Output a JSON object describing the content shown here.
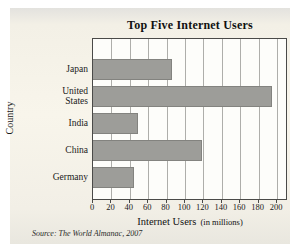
{
  "chart_data": {
    "type": "bar",
    "orientation": "horizontal",
    "title": "Top Five Internet Users",
    "categories": [
      "Japan",
      "United States",
      "India",
      "China",
      "Germany"
    ],
    "values": [
      86,
      195,
      49,
      119,
      45
    ],
    "xlabel": "Internet Users",
    "xlabel_unit": "(in millions)",
    "ylabel": "Country",
    "xticks": [
      0,
      20,
      40,
      60,
      80,
      100,
      120,
      140,
      160,
      180,
      200
    ],
    "xlim": [
      0,
      212
    ],
    "grid": true,
    "legend": "none",
    "bar_color": "#9d9d99",
    "plot_bg": "#fdfdfa",
    "panel_bg": "#f3f0e6",
    "source": "Source: The World Almanac, 2007"
  }
}
